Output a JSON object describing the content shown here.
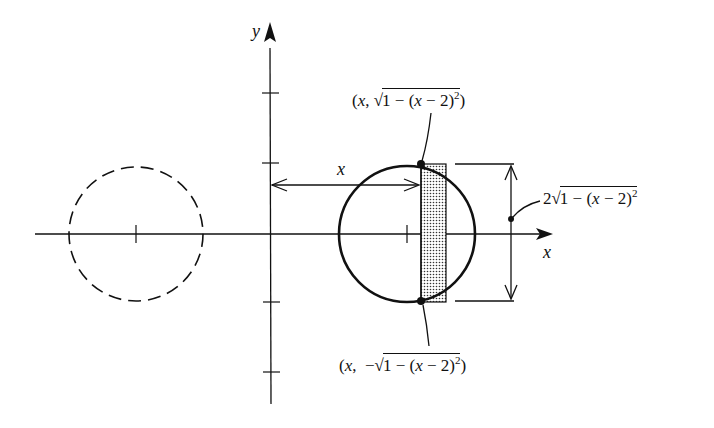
{
  "diagram": {
    "type": "washer-method solid of revolution cross-section",
    "colors": {
      "ink": "#111111",
      "background": "#ffffff",
      "strip_fill": "#bdbdbd"
    },
    "axes": {
      "x_label": "x",
      "y_label": "y",
      "y_ticks": [
        2,
        1,
        -1,
        -2
      ],
      "x_ticks": [
        -2,
        2
      ]
    },
    "main_circle": {
      "center": [
        2,
        0
      ],
      "radius": 1,
      "style": "solid"
    },
    "reflected_circle": {
      "center": [
        -2,
        0
      ],
      "radius": 1,
      "style": "dashed"
    },
    "strip": {
      "description": "shaded vertical rectangle at x"
    },
    "labels": {
      "distance_label": "x",
      "top_point": {
        "open": "(",
        "x": "x",
        "comma": ",",
        "sign": "",
        "root": "√",
        "radicand_a": "1 − (",
        "radicand_x": "x",
        "radicand_b": " − 2)",
        "exp": "2",
        "close": ")"
      },
      "bottom_point": {
        "open": "(",
        "x": "x",
        "comma": ",",
        "sign": "−",
        "root": "√",
        "radicand_a": "1 − (",
        "radicand_x": "x",
        "radicand_b": " − 2)",
        "exp": "2",
        "close": ")"
      },
      "height": {
        "coef": "2",
        "root": "√",
        "radicand_a": "1 − (",
        "radicand_x": "x",
        "radicand_b": " − 2)",
        "exp": "2"
      }
    }
  }
}
